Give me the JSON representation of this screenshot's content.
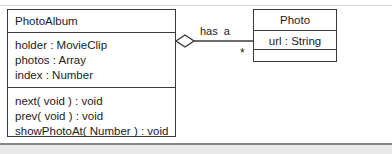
{
  "diagram": {
    "type": "uml-class-diagram",
    "background": "#ffffff",
    "stroke_color": "#3a3a3c",
    "text_color": "#1b1b1d",
    "band_color": "#e9e9ea",
    "classes": [
      {
        "id": "photoalbum",
        "name": "PhotoAlbum",
        "attributes": [
          "holder : MovieClip",
          "photos : Array",
          "index : Number"
        ],
        "operations": [
          "next( void ) : void",
          "prev( void ) : void",
          "showPhotoAt( Number ) : void"
        ]
      },
      {
        "id": "photo",
        "name": "Photo",
        "attributes": [
          "url : String"
        ],
        "operations": []
      }
    ],
    "relationship": {
      "kind": "aggregation",
      "label": "has  a",
      "source_multiplicity": "",
      "target_multiplicity": "*",
      "source": "PhotoAlbum",
      "target": "Photo"
    }
  }
}
